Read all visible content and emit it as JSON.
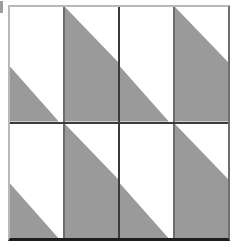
{
  "figure": {
    "width": 235,
    "height": 247,
    "background_color": "#ffffff"
  },
  "colors": {
    "fill_gray": "#9a9a9a",
    "fill_white": "#ffffff",
    "divider_dark": "#3b3b3b",
    "panel_divider": "#6d6d6d",
    "frame_light": "#b9b9b9",
    "frame_right": "#6f6f6f",
    "frame_bottom": "#1d1d1d",
    "edge_tick": "#4a4a4a"
  },
  "frame": {
    "left": 8,
    "top": 5,
    "width": 222,
    "height": 236
  },
  "motif": {
    "name": "half-drop diagonal triangle",
    "panels_per_quadrant": 2,
    "panel_a_name": "lower-left-triangle-panel",
    "panel_a_shape": "triangle occupying the lower-left portion, hypotenuse running from the left edge at 52% height down to the bottom edge at 92% width",
    "panel_b_name": "upper-left-wedge-panel",
    "panel_b_shape": "wedge filling the left and lower area, hypotenuse running from the top-left corner down to the right edge at 48% height"
  },
  "quadrants": [
    {
      "name": "top-left-quadrant",
      "row": 1,
      "column": 1
    },
    {
      "name": "top-right-quadrant",
      "row": 1,
      "column": 2
    },
    {
      "name": "bottom-left-quadrant",
      "row": 2,
      "column": 1
    },
    {
      "name": "bottom-right-quadrant",
      "row": 2,
      "column": 2
    }
  ]
}
